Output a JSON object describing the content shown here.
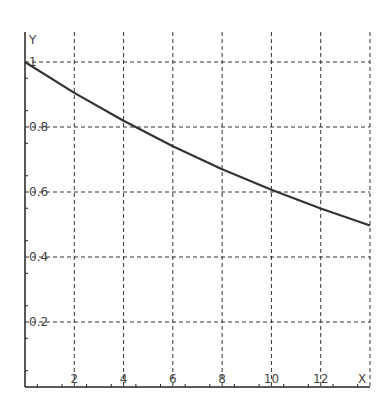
{
  "chart_data": {
    "type": "line",
    "title": "",
    "xlabel": "X",
    "ylabel": "Y",
    "xlim": [
      0,
      14
    ],
    "ylim": [
      0,
      1
    ],
    "grid": true,
    "x_ticks": [
      2,
      4,
      6,
      8,
      10,
      12
    ],
    "x_tick_labels": [
      "2",
      "4",
      "6",
      "8",
      "10",
      "12"
    ],
    "y_ticks": [
      0.2,
      0.4,
      0.6,
      0.8,
      1
    ],
    "y_tick_labels": [
      "0.2",
      "0.4",
      "0.6",
      "0.8",
      "1"
    ],
    "series": [
      {
        "name": "curve",
        "x": [
          0,
          2,
          4,
          6,
          8,
          10,
          12,
          14
        ],
        "values": [
          1.0,
          0.905,
          0.819,
          0.741,
          0.67,
          0.607,
          0.549,
          0.497
        ]
      }
    ]
  },
  "colors": {
    "axis": "#222222",
    "grid": "#333333",
    "curve": "#333333",
    "text": "#444444"
  }
}
